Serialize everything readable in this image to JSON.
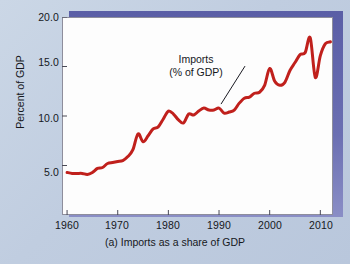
{
  "figure": {
    "caption": "(a) Imports as a share of GDP",
    "background_color": "#c3d0e2",
    "shadow_color": "#5c60a8",
    "plot_background": "#fdfdfd"
  },
  "axes": {
    "ylabel": "Percent of GDP",
    "xlabel": "",
    "yticks": [
      "5.0",
      "10.0",
      "15.0",
      "20.0"
    ],
    "xticks": [
      "1960",
      "1970",
      "1980",
      "1990",
      "2000",
      "2010"
    ]
  },
  "annotation": {
    "line1": "Imports",
    "line2": "(% of GDP)"
  },
  "chart_data": {
    "type": "line",
    "title": "(a) Imports as a share of GDP",
    "xlabel": "",
    "ylabel": "Percent of GDP",
    "xlim": [
      1959,
      2012.5
    ],
    "ylim": [
      0,
      20
    ],
    "yticks": [
      5.0,
      10.0,
      15.0,
      20.0
    ],
    "xticks": [
      1960,
      1970,
      1980,
      1990,
      2000,
      2010
    ],
    "grid": false,
    "legend": "none",
    "line_color": "#c0201c",
    "line_width": 3,
    "series": [
      {
        "name": "Imports (% of GDP)",
        "x": [
          1960,
          1961,
          1962,
          1963,
          1964,
          1965,
          1966,
          1967,
          1968,
          1969,
          1970,
          1971,
          1972,
          1973,
          1974,
          1975,
          1976,
          1977,
          1978,
          1979,
          1980,
          1981,
          1982,
          1983,
          1984,
          1985,
          1986,
          1987,
          1988,
          1989,
          1990,
          1991,
          1992,
          1993,
          1994,
          1995,
          1996,
          1997,
          1998,
          1999,
          2000,
          2001,
          2002,
          2003,
          2004,
          2005,
          2006,
          2007,
          2008,
          2009,
          2010,
          2011,
          2012
        ],
        "values": [
          4.3,
          4.2,
          4.2,
          4.2,
          4.1,
          4.3,
          4.7,
          4.8,
          5.2,
          5.3,
          5.4,
          5.5,
          5.9,
          6.6,
          8.2,
          7.4,
          8.0,
          8.7,
          8.9,
          9.7,
          10.5,
          10.2,
          9.6,
          9.3,
          10.2,
          10.1,
          10.5,
          10.8,
          10.6,
          10.6,
          10.8,
          10.3,
          10.4,
          10.6,
          11.3,
          11.8,
          11.9,
          12.3,
          12.4,
          13.1,
          14.8,
          13.5,
          13.1,
          13.4,
          14.6,
          15.4,
          16.2,
          16.4,
          17.9,
          13.9,
          16.1,
          17.3,
          17.5
        ]
      }
    ],
    "annotations": [
      {
        "text": "Imports (% of GDP)",
        "text_lines": [
          "Imports",
          "(% of GDP)"
        ],
        "points_to_x": 1990,
        "points_to_y": 10.8
      }
    ]
  }
}
